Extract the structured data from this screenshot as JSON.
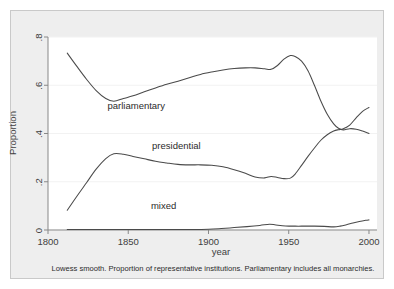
{
  "figure": {
    "caption": "Lowess smooth. Proportion of representative institutions. Parliamentary includes all monarchies.",
    "background_color": "#eeeeee",
    "plot_background_color": "#ffffff",
    "curve_color": "#4a4a4a"
  },
  "chart_data": {
    "type": "line",
    "title": "",
    "subtitle": "",
    "caption": "Lowess smooth. Proportion of representative institutions. Parliamentary includes all monarchies.",
    "xlabel": "year",
    "ylabel": "Proportion",
    "xlim": [
      1800,
      2005
    ],
    "ylim": [
      0,
      0.8
    ],
    "xticks": [
      1800,
      1850,
      1900,
      1950,
      2000
    ],
    "xtick_labels": [
      "1800",
      "1850",
      "1900",
      "1950",
      "2000"
    ],
    "yticks": [
      0,
      0.2,
      0.4,
      0.6,
      0.8
    ],
    "ytick_labels": [
      "0",
      ".2",
      ".4",
      ".6",
      ".8"
    ],
    "grid": true,
    "grid_axis": "y",
    "legend": "inline-annotations",
    "annotations": [
      {
        "text": "parliamentary",
        "x": 1855,
        "y": 0.5
      },
      {
        "text": "presidential",
        "x": 1880,
        "y": 0.335
      },
      {
        "text": "mixed",
        "x": 1872,
        "y": 0.085
      }
    ],
    "series": [
      {
        "name": "parliamentary",
        "color": "#4a4a4a",
        "x": [
          1812,
          1818,
          1824,
          1830,
          1836,
          1841,
          1847,
          1853,
          1860,
          1867,
          1874,
          1881,
          1888,
          1895,
          1902,
          1909,
          1916,
          1923,
          1929,
          1935,
          1939,
          1943,
          1947,
          1951,
          1954,
          1958,
          1962,
          1966,
          1970,
          1974,
          1978,
          1981,
          1984,
          1988,
          1992,
          1996,
          2000
        ],
        "y": [
          0.733,
          0.678,
          0.625,
          0.578,
          0.545,
          0.534,
          0.545,
          0.556,
          0.573,
          0.589,
          0.604,
          0.617,
          0.631,
          0.645,
          0.655,
          0.663,
          0.669,
          0.672,
          0.672,
          0.668,
          0.666,
          0.682,
          0.708,
          0.723,
          0.719,
          0.7,
          0.66,
          0.6,
          0.535,
          0.48,
          0.44,
          0.422,
          0.415,
          0.42,
          0.418,
          0.41,
          0.4
        ]
      },
      {
        "name": "presidential",
        "color": "#4a4a4a",
        "x": [
          1812,
          1818,
          1824,
          1830,
          1836,
          1841,
          1847,
          1853,
          1860,
          1867,
          1874,
          1881,
          1888,
          1895,
          1902,
          1909,
          1916,
          1923,
          1929,
          1935,
          1939,
          1943,
          1947,
          1951,
          1954,
          1958,
          1962,
          1966,
          1970,
          1974,
          1978,
          1981,
          1984,
          1988,
          1992,
          1996,
          2000
        ],
        "y": [
          0.082,
          0.14,
          0.196,
          0.252,
          0.296,
          0.316,
          0.314,
          0.305,
          0.295,
          0.285,
          0.278,
          0.272,
          0.27,
          0.27,
          0.268,
          0.262,
          0.25,
          0.235,
          0.22,
          0.216,
          0.222,
          0.218,
          0.213,
          0.215,
          0.232,
          0.268,
          0.305,
          0.34,
          0.372,
          0.395,
          0.41,
          0.416,
          0.42,
          0.435,
          0.465,
          0.492,
          0.508
        ]
      },
      {
        "name": "mixed",
        "color": "#4a4a4a",
        "x": [
          1812,
          1830,
          1850,
          1870,
          1890,
          1900,
          1908,
          1916,
          1924,
          1932,
          1938,
          1942,
          1948,
          1954,
          1960,
          1966,
          1972,
          1978,
          1982,
          1986,
          1990,
          1994,
          1998,
          2000
        ],
        "y": [
          0.002,
          0.002,
          0.002,
          0.002,
          0.002,
          0.003,
          0.006,
          0.01,
          0.014,
          0.019,
          0.024,
          0.021,
          0.017,
          0.016,
          0.016,
          0.016,
          0.015,
          0.013,
          0.016,
          0.022,
          0.029,
          0.035,
          0.04,
          0.042
        ]
      }
    ]
  }
}
